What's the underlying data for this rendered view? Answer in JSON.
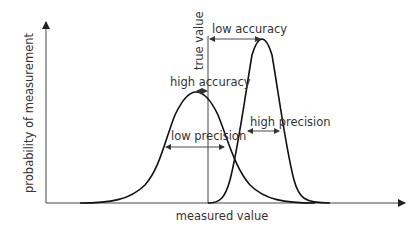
{
  "diagram": {
    "axes": {
      "y_label": "probability of measurement",
      "x_label": "measured value"
    },
    "reference_line": {
      "label": "true value"
    },
    "curves": [
      {
        "name": "wide-curve",
        "description": "high accuracy, low precision"
      },
      {
        "name": "narrow-curve",
        "description": "low accuracy, high precision"
      }
    ],
    "annotations": {
      "high_accuracy": "high accuracy",
      "low_accuracy": "low accuracy",
      "low_precision": "low precision",
      "high_precision": "high precision"
    },
    "colors": {
      "line": "#111111",
      "axis": "#444444",
      "text": "#333333",
      "background": "#ffffff"
    }
  }
}
